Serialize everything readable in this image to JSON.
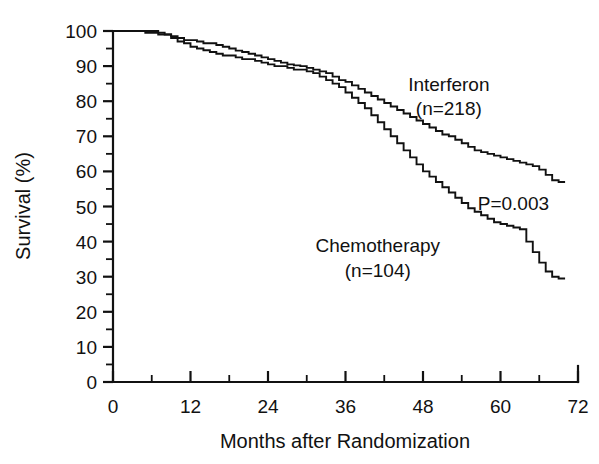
{
  "chart_data": {
    "type": "line",
    "title": "",
    "subtitle": "",
    "xlabel": "Months after Randomization",
    "ylabel": "Survival (%)",
    "xlim": [
      0,
      72
    ],
    "ylim": [
      0,
      100
    ],
    "grid": false,
    "legend_position": "inline-annotation",
    "x_ticks_major": [
      0,
      12,
      24,
      36,
      48,
      60,
      72
    ],
    "x_tick_labels": [
      "0",
      "12",
      "24",
      "36",
      "48",
      "60",
      "72"
    ],
    "x_ticks_minor": [
      6,
      18,
      30,
      42,
      54,
      66
    ],
    "y_ticks_major": [
      0,
      10,
      20,
      30,
      40,
      50,
      60,
      70,
      80,
      90,
      100
    ],
    "y_tick_labels": [
      "0",
      "10",
      "20",
      "30",
      "40",
      "50",
      "60",
      "70",
      "80",
      "90",
      "100"
    ],
    "y_ticks_minor": [
      5,
      15,
      25,
      35,
      45,
      55,
      65,
      75,
      85,
      95
    ],
    "annotations": [
      {
        "text": "Interferon",
        "x": 52,
        "y": 83
      },
      {
        "text": "(n=218)",
        "x": 52,
        "y": 76
      },
      {
        "text": "Chemotherapy",
        "x": 41,
        "y": 37
      },
      {
        "text": "(n=104)",
        "x": 41,
        "y": 30
      },
      {
        "text": "P=0.003",
        "x": 62,
        "y": 49
      }
    ],
    "series": [
      {
        "name": "Interferon",
        "n": 218,
        "step": "post",
        "x": [
          0,
          3,
          5,
          8,
          9,
          10,
          11,
          12,
          13,
          14,
          15,
          16,
          17,
          18,
          19,
          20,
          21,
          22,
          23,
          24,
          25,
          26,
          27,
          28,
          29,
          30,
          31,
          32,
          33,
          34,
          35,
          36,
          37,
          38,
          39,
          40,
          41,
          42,
          43,
          44,
          45,
          46,
          47,
          48,
          49,
          50,
          51,
          52,
          53,
          54,
          55,
          56,
          57,
          58,
          59,
          60,
          61,
          62,
          63,
          64,
          65,
          66,
          67,
          68,
          69,
          70
        ],
        "y": [
          100,
          100,
          99.5,
          99.0,
          98.5,
          98.0,
          97.4,
          97.4,
          97.0,
          96.5,
          96.5,
          96.0,
          95.5,
          95.0,
          94.4,
          94.0,
          93.5,
          93.0,
          92.5,
          92.0,
          91.5,
          91.0,
          90.5,
          90.2,
          90.0,
          89.5,
          89.0,
          88.5,
          88.0,
          87.0,
          86.0,
          85.5,
          84.5,
          83.5,
          82.5,
          81.5,
          80.5,
          79.5,
          78.5,
          77.5,
          76.5,
          75.5,
          74.5,
          73.5,
          72.5,
          71.5,
          70.5,
          70.0,
          69.0,
          68.0,
          67.0,
          66.0,
          65.5,
          65.0,
          64.5,
          64.0,
          63.5,
          63.0,
          62.5,
          62.0,
          61.5,
          60.5,
          59.0,
          57.5,
          57.0,
          57.0
        ]
      },
      {
        "name": "Chemotherapy",
        "n": 104,
        "step": "post",
        "x": [
          0,
          4,
          7,
          9,
          10,
          11,
          12,
          13,
          14,
          15,
          16,
          17,
          18,
          19,
          20,
          21,
          22,
          23,
          24,
          25,
          26,
          27,
          28,
          29,
          30,
          31,
          32,
          33,
          34,
          35,
          36,
          37,
          38,
          39,
          40,
          41,
          42,
          43,
          44,
          45,
          46,
          47,
          48,
          49,
          50,
          51,
          52,
          53,
          54,
          55,
          56,
          57,
          58,
          59,
          60,
          61,
          62,
          63,
          64,
          65,
          66,
          67,
          68,
          69,
          70
        ],
        "y": [
          100,
          100,
          99.0,
          98.0,
          97.0,
          96.5,
          95.5,
          95.0,
          94.5,
          94.0,
          93.5,
          93.0,
          93.0,
          92.5,
          92.0,
          92.0,
          91.5,
          91.0,
          90.5,
          90.0,
          90.0,
          89.5,
          89.0,
          89.0,
          88.5,
          88.0,
          87.0,
          86.0,
          85.0,
          84.0,
          82.5,
          81.0,
          79.5,
          78.0,
          76.0,
          74.0,
          72.0,
          70.0,
          68.0,
          66.0,
          64.0,
          62.0,
          60.0,
          58.5,
          57.0,
          55.5,
          54.0,
          52.5,
          51.0,
          49.5,
          48.5,
          47.5,
          46.5,
          45.5,
          45.0,
          44.5,
          44.0,
          43.5,
          40.0,
          37.0,
          34.0,
          31.5,
          30.0,
          29.5,
          29.5
        ]
      }
    ]
  }
}
